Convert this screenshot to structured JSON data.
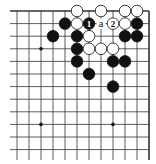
{
  "diagram": {
    "title": "",
    "grid": {
      "columns_x": [
        17,
        29,
        41,
        53,
        65,
        77,
        89,
        101,
        113,
        125,
        137,
        149
      ],
      "rows_y": [
        11,
        23.6,
        36.2,
        48.8,
        61.4,
        74,
        86.6,
        99.2,
        111.8,
        124.4,
        137,
        149.6
      ],
      "left_extend_x": 10,
      "bottom_extend_y": 160,
      "top_edge": true,
      "right_edge": true,
      "line_color": "#333333"
    },
    "star_points": [
      {
        "c": 2,
        "r": 3
      },
      {
        "c": 8,
        "r": 3
      },
      {
        "c": 2,
        "r": 9
      },
      {
        "c": 8,
        "r": 9
      }
    ],
    "stones": [
      {
        "color": "white",
        "c": 5,
        "r": 0
      },
      {
        "color": "white",
        "c": 7,
        "r": 0
      },
      {
        "color": "white",
        "c": 9,
        "r": 0
      },
      {
        "color": "white",
        "c": 10,
        "r": 0
      },
      {
        "color": "black",
        "c": 4,
        "r": 1
      },
      {
        "color": "white",
        "c": 5,
        "r": 1
      },
      {
        "color": "black",
        "c": 6,
        "r": 1,
        "label": "1"
      },
      {
        "color": "white",
        "c": 8,
        "r": 1,
        "label": "2"
      },
      {
        "color": "white",
        "c": 9,
        "r": 1
      },
      {
        "color": "black",
        "c": 10,
        "r": 1
      },
      {
        "color": "black",
        "c": 3,
        "r": 2
      },
      {
        "color": "black",
        "c": 5,
        "r": 2
      },
      {
        "color": "white",
        "c": 6,
        "r": 2
      },
      {
        "color": "black",
        "c": 9,
        "r": 2
      },
      {
        "color": "black",
        "c": 10,
        "r": 2
      },
      {
        "color": "black",
        "c": 5,
        "r": 3
      },
      {
        "color": "white",
        "c": 6,
        "r": 3
      },
      {
        "color": "white",
        "c": 7,
        "r": 3
      },
      {
        "color": "white",
        "c": 8,
        "r": 3
      },
      {
        "color": "black",
        "c": 5,
        "r": 4
      },
      {
        "color": "black",
        "c": 8,
        "r": 4
      },
      {
        "color": "black",
        "c": 9,
        "r": 4
      },
      {
        "color": "black",
        "c": 6,
        "r": 5
      },
      {
        "color": "black",
        "c": 8,
        "r": 6
      }
    ],
    "point_labels": [
      {
        "text": "a",
        "c": 7,
        "r": 1
      }
    ]
  }
}
